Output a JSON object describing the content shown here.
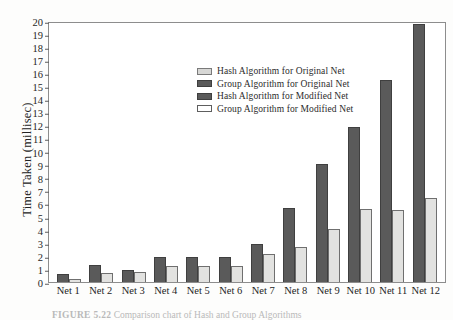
{
  "figure": {
    "caption_label": "FIGURE 5.22",
    "caption_text": "Comparison chart of Hash and Group Algorithms"
  },
  "legend": {
    "position": "inside-top-left",
    "items": [
      {
        "label": "Hash Algorithm for Original Net",
        "swatch": "s-lightgray",
        "color": "#d7d7d5"
      },
      {
        "label": "Group Algorithm for Original Net",
        "swatch": "s-dark",
        "color": "#5a5a5a"
      },
      {
        "label": "Hash Algorithm for Modified Net",
        "swatch": "s-dark2",
        "color": "#5a5a5a"
      },
      {
        "label": "Group Algorithm for Modified Net",
        "swatch": "s-white",
        "color": "#ffffff"
      }
    ]
  },
  "axes": {
    "ylabel": "Time Taken (millisec)",
    "xlabel": "",
    "yticks": [
      20,
      19,
      18,
      17,
      16,
      15,
      14,
      13,
      12,
      11,
      10,
      9,
      8,
      7,
      6,
      5,
      4,
      3,
      2,
      1,
      0
    ]
  },
  "chart_data": {
    "type": "bar",
    "title": "",
    "xlabel": "",
    "ylabel": "Time Taken (millisec)",
    "ylim": [
      0,
      20
    ],
    "ytick_step": 1,
    "grid": false,
    "legend_position": "inside-top-left",
    "categories": [
      "Net 1",
      "Net 2",
      "Net 3",
      "Net 4",
      "Net 5",
      "Net 6",
      "Net 7",
      "Net 8",
      "Net 9",
      "Net 10",
      "Net 11",
      "Net 12"
    ],
    "series": [
      {
        "name": "Group Algorithm for Original Net",
        "color": "#5a5a5a",
        "values": [
          0.65,
          1.35,
          0.95,
          1.9,
          1.9,
          1.9,
          2.95,
          5.75,
          9.15,
          12.0,
          15.6,
          19.9
        ]
      },
      {
        "name": "Group Algorithm for Modified Net",
        "color": "#e2e2e0",
        "values": [
          0.25,
          0.7,
          0.75,
          1.25,
          1.25,
          1.25,
          2.2,
          2.7,
          4.1,
          5.6,
          5.55,
          6.5
        ]
      }
    ]
  }
}
